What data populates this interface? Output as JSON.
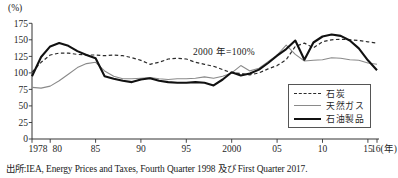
{
  "page": {
    "background": "#ffffff"
  },
  "chart": {
    "unit_label": "(%)",
    "annotation": "2000 年=100%",
    "source": "出所:IEA, Energy Prices and Taxes, Fourth Quarter 1998 及び First Quarter 2017.",
    "axis_color": "#333333",
    "text_color": "#1f1f1f"
  },
  "chart_data": {
    "type": "line",
    "title": "",
    "xlabel": "(年)",
    "ylabel": "(%)",
    "ylim": [
      0,
      175
    ],
    "grid": false,
    "legend_position": "inside-bottom-right-box",
    "annotation": "2000 年=100%",
    "x": [
      1978,
      1979,
      1980,
      1981,
      1982,
      1983,
      1984,
      1985,
      1986,
      1987,
      1988,
      1989,
      1990,
      1991,
      1992,
      1993,
      1994,
      1995,
      1996,
      1997,
      1998,
      1999,
      2000,
      2001,
      2002,
      2003,
      2004,
      2005,
      2006,
      2007,
      2008,
      2009,
      2010,
      2011,
      2012,
      2013,
      2014,
      2015,
      2016
    ],
    "series": [
      {
        "name": "石炭",
        "style": "dashed",
        "color": "#2b2b2b",
        "width": 1.2,
        "values": [
          101,
          116,
          127,
          130,
          130,
          128,
          127,
          127,
          126,
          127,
          126,
          123,
          119,
          113,
          116,
          121,
          122,
          121,
          116,
          113,
          110,
          105,
          100,
          99,
          97,
          100,
          106,
          111,
          120,
          140,
          145,
          138,
          147,
          150,
          151,
          150,
          149,
          147,
          145
        ]
      },
      {
        "name": "天然ガス",
        "style": "solid",
        "color": "#8a8a8a",
        "width": 1.1,
        "values": [
          78,
          77,
          80,
          88,
          98,
          108,
          114,
          116,
          103,
          95,
          91,
          91,
          92,
          93,
          91,
          90,
          91,
          91,
          92,
          94,
          92,
          95,
          100,
          111,
          103,
          107,
          117,
          127,
          142,
          128,
          118,
          119,
          120,
          123,
          122,
          120,
          119,
          115,
          113
        ]
      },
      {
        "name": "石油製品",
        "style": "solid",
        "color": "#111111",
        "width": 2.1,
        "values": [
          95,
          124,
          140,
          145,
          141,
          133,
          127,
          122,
          95,
          91,
          88,
          86,
          90,
          92,
          88,
          86,
          85,
          85,
          86,
          85,
          81,
          90,
          101,
          96,
          99,
          105,
          115,
          126,
          136,
          149,
          120,
          146,
          155,
          158,
          156,
          149,
          137,
          119,
          104
        ]
      }
    ],
    "yticks": [
      0,
      25,
      50,
      75,
      100,
      125,
      150,
      175
    ],
    "xticks": [
      {
        "year": 1978,
        "label": "1978",
        "dx": 6
      },
      {
        "year": 1980,
        "label": "80",
        "dx": 7
      },
      {
        "year": 1985,
        "label": "85"
      },
      {
        "year": 1990,
        "label": "90"
      },
      {
        "year": 1995,
        "label": "95"
      },
      {
        "year": 2000,
        "label": "2000"
      },
      {
        "year": 2005,
        "label": "05"
      },
      {
        "year": 2010,
        "label": "10"
      },
      {
        "year": 2015,
        "label": "15"
      },
      {
        "year": 2016,
        "label": "16(年)",
        "anchor": "start",
        "dx": -6
      }
    ]
  }
}
